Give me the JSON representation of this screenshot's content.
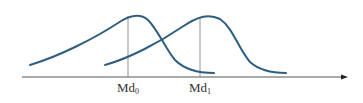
{
  "diagram": {
    "colors": {
      "curve": "#2e5f80",
      "axis": "#555555",
      "median_line": "#777777",
      "label": "#333333"
    },
    "axis": {
      "x_start": 22,
      "x_end": 347,
      "y": 77
    },
    "curves": [
      {
        "name": "distribution-0",
        "path": "M30,65 C60,56 95,38 118,23 C130,15 140,13 148,20 C158,30 165,48 175,60 C185,70 198,73 214,73"
      },
      {
        "name": "distribution-1",
        "path": "M105,65 C130,58 160,42 182,27 C197,17 208,13 220,19 C233,28 238,48 250,62 C260,71 272,73 286,73"
      }
    ],
    "medians": [
      {
        "name": "Md",
        "subscript": "0",
        "x": 128,
        "y_top": 16,
        "label_y": 80
      },
      {
        "name": "Md",
        "subscript": "1",
        "x": 200,
        "y_top": 17,
        "label_y": 80
      }
    ]
  }
}
